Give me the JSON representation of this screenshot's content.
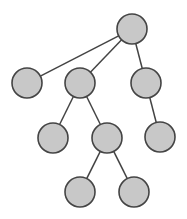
{
  "diagram": {
    "type": "tree",
    "style": {
      "node_fill": "#c8c8c8",
      "node_stroke": "#444444",
      "edge_color": "#444444",
      "background": "#ffffff",
      "node_radius": 15
    },
    "nodes": [
      {
        "id": "root",
        "cx": 132,
        "cy": 29
      },
      {
        "id": "a",
        "cx": 27,
        "cy": 83
      },
      {
        "id": "b",
        "cx": 80,
        "cy": 83
      },
      {
        "id": "c",
        "cx": 146,
        "cy": 83
      },
      {
        "id": "b1",
        "cx": 53,
        "cy": 138
      },
      {
        "id": "b2",
        "cx": 107,
        "cy": 138
      },
      {
        "id": "c1",
        "cx": 160,
        "cy": 137
      },
      {
        "id": "b2a",
        "cx": 80,
        "cy": 192
      },
      {
        "id": "b2b",
        "cx": 134,
        "cy": 192
      }
    ],
    "edges": [
      {
        "from": "root",
        "to": "a"
      },
      {
        "from": "root",
        "to": "b"
      },
      {
        "from": "root",
        "to": "c"
      },
      {
        "from": "b",
        "to": "b1"
      },
      {
        "from": "b",
        "to": "b2"
      },
      {
        "from": "c",
        "to": "c1"
      },
      {
        "from": "b2",
        "to": "b2a"
      },
      {
        "from": "b2",
        "to": "b2b"
      }
    ]
  }
}
